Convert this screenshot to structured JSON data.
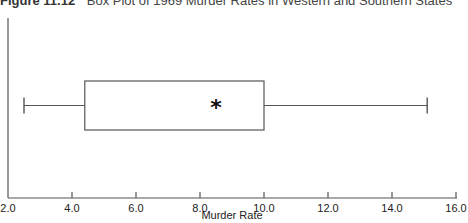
{
  "title": {
    "figure_label": "Figure 11.12",
    "caption": "Box Plot of 1969 Murder Rates in Western and Southern States"
  },
  "chart_data": {
    "type": "boxplot",
    "orientation": "horizontal",
    "title": "Box Plot of 1969 Murder Rates in Western and Southern States",
    "xlabel": "Murder Rate",
    "ylabel": "",
    "xlim": [
      2.0,
      16.0
    ],
    "xticks": [
      2.0,
      4.0,
      6.0,
      8.0,
      10.0,
      12.0,
      14.0,
      16.0
    ],
    "xtick_labels": [
      "2.0",
      "4.0",
      "6.0",
      "8.0",
      "10.0",
      "12.0",
      "14.0",
      "16.0"
    ],
    "series": [
      {
        "name": "Murder Rates",
        "min": 2.5,
        "q1": 4.4,
        "q3": 10.0,
        "max": 15.1,
        "mean": 8.5,
        "mean_marker": "*"
      }
    ],
    "grid": false,
    "legend": null
  },
  "colors": {
    "axis": "#555555",
    "box": "#555555",
    "marker": "#111111"
  }
}
